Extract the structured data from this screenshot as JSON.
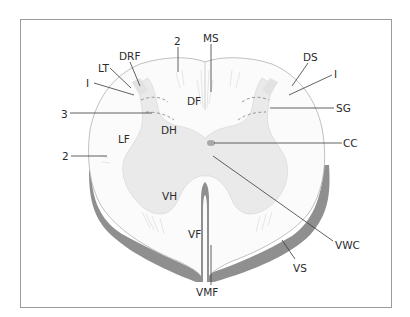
{
  "figure": {
    "colors": {
      "white_matter": "#fbfbfb",
      "grey_matter": "#eaeaea",
      "pia_shadow": "#8f8f8f",
      "frame": "#9b9b9b",
      "central_canal": "#a8a8a8",
      "label_text": "#2a2a2a"
    },
    "labels": {
      "ms": "MS",
      "two_top": "2",
      "drf": "DRF",
      "lt": "LT",
      "one_left": "I",
      "three": "3",
      "df": "DF",
      "dh": "DH",
      "lf": "LF",
      "two_left": "2",
      "vh": "VH",
      "vf": "VF",
      "vmf": "VMF",
      "ds": "DS",
      "one_right": "I",
      "sg": "SG",
      "cc": "CC",
      "vwc": "VWC",
      "vs": "VS"
    }
  }
}
